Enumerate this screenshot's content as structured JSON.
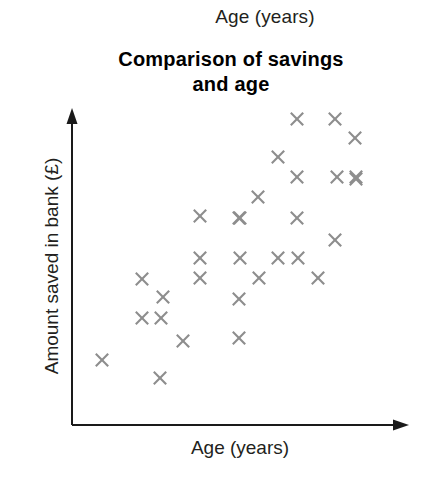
{
  "top_caption": "Age (years)",
  "colors": {
    "marker": "#8d8d8d",
    "axis": "#1a1a1a",
    "text": "#231f20",
    "background": "#ffffff"
  },
  "axes": {
    "y_label": "Amount saved in bank (£)",
    "x_label": "Age (years)"
  },
  "chart_data": {
    "type": "scatter",
    "title": "Comparison of savings and age",
    "title_lines": [
      "Comparison of savings",
      "and age"
    ],
    "xlabel": "Age (years)",
    "ylabel": "Amount saved in bank (£)",
    "grid": false,
    "legend": null,
    "xlim": [
      0,
      100
    ],
    "ylim": [
      0,
      100
    ],
    "axis_ticks": false,
    "axis_style": "arrow",
    "marker": "x",
    "marker_color": "#8d8d8d",
    "n_points": 30,
    "points": [
      {
        "px": 297,
        "py": 119,
        "x": 67,
        "y": 88
      },
      {
        "px": 335,
        "py": 119,
        "x": 78,
        "y": 88
      },
      {
        "px": 355,
        "py": 138,
        "x": 84,
        "y": 82
      },
      {
        "px": 278,
        "py": 157,
        "x": 61,
        "y": 76
      },
      {
        "px": 297,
        "py": 177,
        "x": 67,
        "y": 70
      },
      {
        "px": 337,
        "py": 177,
        "x": 79,
        "y": 70
      },
      {
        "px": 356,
        "py": 177,
        "x": 85,
        "y": 70
      },
      {
        "px": 258,
        "py": 197,
        "x": 56,
        "y": 64
      },
      {
        "px": 200,
        "py": 216,
        "x": 38,
        "y": 58
      },
      {
        "px": 239,
        "py": 218,
        "x": 50,
        "y": 57
      },
      {
        "px": 297,
        "py": 218,
        "x": 67,
        "y": 57
      },
      {
        "px": 335,
        "py": 240,
        "x": 78,
        "y": 51
      },
      {
        "px": 200,
        "py": 258,
        "x": 38,
        "y": 45
      },
      {
        "px": 240,
        "py": 258,
        "x": 50,
        "y": 45
      },
      {
        "px": 278,
        "py": 258,
        "x": 62,
        "y": 45
      },
      {
        "px": 298,
        "py": 258,
        "x": 68,
        "y": 45
      },
      {
        "px": 259,
        "py": 278,
        "x": 56,
        "y": 39
      },
      {
        "px": 318,
        "py": 278,
        "x": 74,
        "y": 39
      },
      {
        "px": 142,
        "py": 279,
        "x": 21,
        "y": 39
      },
      {
        "px": 200,
        "py": 278,
        "x": 38,
        "y": 39
      },
      {
        "px": 163,
        "py": 297,
        "x": 27,
        "y": 33
      },
      {
        "px": 239,
        "py": 299,
        "x": 50,
        "y": 33
      },
      {
        "px": 142,
        "py": 318,
        "x": 21,
        "y": 27
      },
      {
        "px": 161,
        "py": 318,
        "x": 27,
        "y": 27
      },
      {
        "px": 239,
        "py": 338,
        "x": 50,
        "y": 21
      },
      {
        "px": 183,
        "py": 341,
        "x": 33,
        "y": 20
      },
      {
        "px": 102,
        "py": 360,
        "x": 9,
        "y": 15
      },
      {
        "px": 160,
        "py": 378,
        "x": 26,
        "y": 9
      },
      {
        "px": 240,
        "py": 218,
        "x": 50,
        "y": 57
      },
      {
        "px": 356,
        "py": 179,
        "x": 85,
        "y": 69
      }
    ]
  }
}
